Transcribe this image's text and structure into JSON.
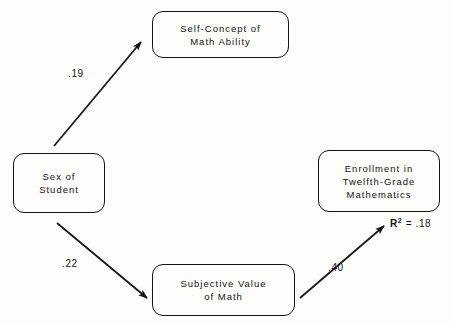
{
  "diagram": {
    "type": "path-diagram",
    "background_color": "#fdfdfb",
    "line_color": "#141414",
    "nodes": [
      {
        "id": "self_concept",
        "lines": [
          "Self-Concept of",
          "Math Ability"
        ]
      },
      {
        "id": "sex_of_student",
        "lines": [
          "Sex of",
          "Student"
        ]
      },
      {
        "id": "enrollment",
        "lines": [
          "Enrollment in",
          "Twelfth-Grade",
          "Mathematics"
        ]
      },
      {
        "id": "subjective_value",
        "lines": [
          "Subjective Value",
          "of Math"
        ]
      }
    ],
    "edges": [
      {
        "id": "sex_to_self_concept",
        "from": "sex_of_student",
        "to": "self_concept",
        "coefficient": ".19"
      },
      {
        "id": "sex_to_subjective_value",
        "from": "sex_of_student",
        "to": "subjective_value",
        "coefficient": ".22"
      },
      {
        "id": "subjective_value_to_enrollment",
        "from": "subjective_value",
        "to": "enrollment",
        "coefficient": ".40"
      }
    ],
    "annotations": [
      {
        "id": "r_squared",
        "symbol": "R",
        "exponent": "2",
        "relation": " = ",
        "value": ".18"
      }
    ]
  }
}
